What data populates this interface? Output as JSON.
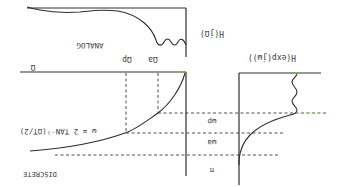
{
  "figure": {
    "orientation": "rotated 180 degrees",
    "analog_label": "ANALOG",
    "discrete_label": "DISCRETE",
    "analog_response_label": "H(jΩ)",
    "discrete_response_label": "H(exp(jω))",
    "mapping_formula": "ω = 2 TAN⁻¹(ΩT/2)",
    "mapping_formula_prefix": "ω=",
    "mapping_formula_frac_num": "1",
    "mapping_formula_frac_den": "2",
    "mapping_formula_body": "TAN⁻¹(ΩT/2)",
    "omega_axis_label": "Ω",
    "omega_p_label": "Ωp",
    "omega_a_label": "Ωa",
    "w_p_label": "ωp",
    "w_a_label": "ωa",
    "pi_label": "π"
  }
}
